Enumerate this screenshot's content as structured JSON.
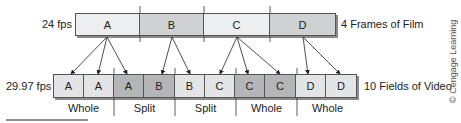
{
  "film": {
    "rate_label": "24 fps",
    "caption": "4 Frames of Film",
    "frames": [
      {
        "label": "A",
        "color": "#eceef0"
      },
      {
        "label": "B",
        "color": "#cfd1d3"
      },
      {
        "label": "C",
        "color": "#eceef0"
      },
      {
        "label": "D",
        "color": "#cfd1d3"
      }
    ]
  },
  "video": {
    "rate_label": "29.97 fps",
    "caption": "10 Fields of Video",
    "fields": [
      {
        "label": "A",
        "color": "#e2e4e6"
      },
      {
        "label": "A",
        "color": "#e2e4e6"
      },
      {
        "label": "A",
        "color": "#b3b5b7"
      },
      {
        "label": "B",
        "color": "#b3b5b7"
      },
      {
        "label": "B",
        "color": "#e2e4e6"
      },
      {
        "label": "C",
        "color": "#e2e4e6"
      },
      {
        "label": "C",
        "color": "#b3b5b7"
      },
      {
        "label": "C",
        "color": "#b3b5b7"
      },
      {
        "label": "D",
        "color": "#e2e4e6"
      },
      {
        "label": "D",
        "color": "#e2e4e6"
      }
    ]
  },
  "groups": [
    {
      "label": "Whole"
    },
    {
      "label": "Split"
    },
    {
      "label": "Split"
    },
    {
      "label": "Whole"
    },
    {
      "label": "Whole"
    }
  ],
  "copyright": "© Cengage Learning"
}
